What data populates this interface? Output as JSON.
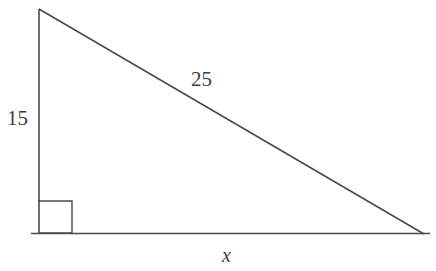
{
  "figure": {
    "kind": "right-triangle-diagram",
    "background_color": "#ffffff",
    "stroke_color": "#4a4a4a",
    "label_color": "#3d3d3d",
    "labels": {
      "vertical_leg": "15",
      "hypotenuse": "25",
      "horizontal_leg": "x"
    },
    "right_angle_marker": {
      "present": true,
      "corner": "bottom-left"
    },
    "geometry": {
      "apex": [
        39,
        9
      ],
      "bottom_left": [
        39,
        233
      ],
      "bottom_right": [
        424,
        234
      ],
      "right_angle_square": [
        38,
        201,
        34,
        32
      ],
      "baseline_start_x": 31,
      "baseline_end_x": 430
    }
  }
}
